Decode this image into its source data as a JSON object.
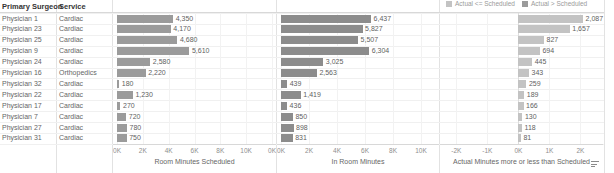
{
  "table": {
    "headers": {
      "surgeon": "Primary Surgeon",
      "service": "Service"
    },
    "rows": [
      {
        "surgeon": "Physician 1",
        "service": "Cardiac",
        "scheduled": 4350,
        "scheduled_label": "4,350",
        "in_room": 6437,
        "in_room_label": "6,437",
        "variance": 2087,
        "variance_label": "2,087",
        "variance_state": "over"
      },
      {
        "surgeon": "Physician 23",
        "service": "Cardiac",
        "scheduled": 4170,
        "scheduled_label": "4,170",
        "in_room": 5827,
        "in_room_label": "5,827",
        "variance": 1657,
        "variance_label": "1,657",
        "variance_state": "over"
      },
      {
        "surgeon": "Physician 25",
        "service": "Cardiac",
        "scheduled": 4680,
        "scheduled_label": "4,680",
        "in_room": 5507,
        "in_room_label": "5,507",
        "variance": 827,
        "variance_label": "827",
        "variance_state": "over"
      },
      {
        "surgeon": "Physician 9",
        "service": "Cardiac",
        "scheduled": 5610,
        "scheduled_label": "5,610",
        "in_room": 6304,
        "in_room_label": "6,304",
        "variance": 694,
        "variance_label": "694",
        "variance_state": "over"
      },
      {
        "surgeon": "Physician 24",
        "service": "Cardiac",
        "scheduled": 2580,
        "scheduled_label": "2,580",
        "in_room": 3025,
        "in_room_label": "3,025",
        "variance": 445,
        "variance_label": "445",
        "variance_state": "over"
      },
      {
        "surgeon": "Physician 16",
        "service": "Orthopedics",
        "scheduled": 2220,
        "scheduled_label": "2,220",
        "in_room": 2563,
        "in_room_label": "2,563",
        "variance": 343,
        "variance_label": "343",
        "variance_state": "over"
      },
      {
        "surgeon": "Physician 32",
        "service": "Cardiac",
        "scheduled": 180,
        "scheduled_label": "180",
        "in_room": 439,
        "in_room_label": "439",
        "variance": 259,
        "variance_label": "259",
        "variance_state": "over"
      },
      {
        "surgeon": "Physician 22",
        "service": "Cardiac",
        "scheduled": 1230,
        "scheduled_label": "1,230",
        "in_room": 1419,
        "in_room_label": "1,419",
        "variance": 189,
        "variance_label": "189",
        "variance_state": "over"
      },
      {
        "surgeon": "Physician 17",
        "service": "Cardiac",
        "scheduled": 270,
        "scheduled_label": "270",
        "in_room": 436,
        "in_room_label": "436",
        "variance": 166,
        "variance_label": "166",
        "variance_state": "over"
      },
      {
        "surgeon": "Physician 7",
        "service": "Cardiac",
        "scheduled": 720,
        "scheduled_label": "720",
        "in_room": 850,
        "in_room_label": "850",
        "variance": 130,
        "variance_label": "130",
        "variance_state": "over"
      },
      {
        "surgeon": "Physician 27",
        "service": "Cardiac",
        "scheduled": 780,
        "scheduled_label": "780",
        "in_room": 898,
        "in_room_label": "898",
        "variance": 118,
        "variance_label": "118",
        "variance_state": "over"
      },
      {
        "surgeon": "Physician 31",
        "service": "Cardiac",
        "scheduled": 750,
        "scheduled_label": "750",
        "in_room": 831,
        "in_room_label": "831",
        "variance": 81,
        "variance_label": "81",
        "variance_state": "over"
      }
    ]
  },
  "legend": {
    "items": [
      {
        "label": "Actual <= Scheduled",
        "color": "#c3c3c3"
      },
      {
        "label": "Actual > Scheduled",
        "color": "#9b9b9b"
      }
    ]
  },
  "charts": [
    {
      "key": "scheduled",
      "axis_title": "Room Minutes Scheduled",
      "ticks": [
        "0K",
        "2K",
        "4K",
        "6K",
        "8K",
        "10K",
        "0K"
      ],
      "tick_values": [
        0,
        2000,
        4000,
        6000,
        8000,
        10000,
        12000
      ],
      "xmin": 0,
      "xmax": 12000
    },
    {
      "key": "in_room",
      "axis_title": "In Room Minutes",
      "ticks": [
        "0K",
        "2K",
        "4K",
        "6K",
        "8K",
        "10K"
      ],
      "tick_values": [
        0,
        2000,
        4000,
        6000,
        8000,
        10000
      ],
      "xmin": 0,
      "xmax": 11000
    },
    {
      "key": "variance",
      "axis_title": "Actual Minutes more or less than Scheduled",
      "ticks": [
        "-2K",
        "-1K",
        "0K",
        "1K",
        "2K"
      ],
      "tick_values": [
        -2000,
        -1000,
        0,
        1000,
        2000
      ],
      "xmin": -2400,
      "xmax": 2600
    }
  ],
  "chart_data": {
    "type": "bar",
    "title": "",
    "categories": [
      "Physician 1",
      "Physician 23",
      "Physician 25",
      "Physician 9",
      "Physician 24",
      "Physician 16",
      "Physician 32",
      "Physician 22",
      "Physician 17",
      "Physician 7",
      "Physician 27",
      "Physician 31"
    ],
    "series": [
      {
        "name": "Room Minutes Scheduled",
        "values": [
          4350,
          4170,
          4680,
          5610,
          2580,
          2220,
          180,
          1230,
          270,
          720,
          780,
          750
        ],
        "xlabel": "Room Minutes Scheduled",
        "xlim": [
          0,
          12000
        ]
      },
      {
        "name": "In Room Minutes",
        "values": [
          6437,
          5827,
          5507,
          6304,
          3025,
          2563,
          439,
          1419,
          436,
          850,
          898,
          831
        ],
        "xlabel": "In Room Minutes",
        "xlim": [
          0,
          11000
        ]
      },
      {
        "name": "Actual Minutes more or less than Scheduled",
        "values": [
          2087,
          1657,
          827,
          694,
          445,
          343,
          259,
          189,
          166,
          130,
          118,
          81
        ],
        "xlabel": "Actual Minutes more or less than Scheduled",
        "xlim": [
          -2400,
          2600
        ]
      }
    ],
    "ylabel": "Primary Surgeon",
    "grid": true,
    "legend_position": "top-right",
    "legend": [
      "Actual <= Scheduled",
      "Actual > Scheduled"
    ]
  },
  "icons": {
    "sort": "sort-icon"
  }
}
